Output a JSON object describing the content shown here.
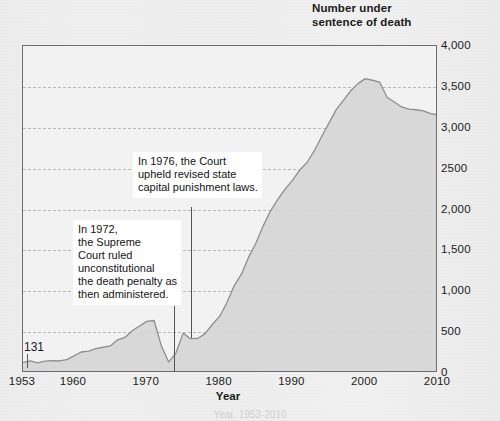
{
  "header": {
    "line1": "Number under",
    "line2": "sentence of death"
  },
  "axis": {
    "x_title": "Year",
    "y_ticks": [
      "4,000",
      "3,500",
      "3,000",
      "2500",
      "2,000",
      "1,500",
      "1,000",
      "500",
      "0"
    ],
    "x_ticks": [
      "1953",
      "1960",
      "1970",
      "1980",
      "1990",
      "2000",
      "2010"
    ]
  },
  "callouts": {
    "start_value": "131"
  },
  "annotations": {
    "note_1976": "In 1976, the Court\nupheld revised state\ncapital punishment laws.",
    "note_1972": "In 1972,\nthe Supreme\nCourt ruled\nunconstitutional\nthe death penalty as\nthen administered."
  },
  "caption": "Year, 1953-2010",
  "colors": {
    "page_background": "#eeeeee",
    "plot_background": "#f2f2f2",
    "frame": "#6d6d6d",
    "gridline": "#b9b9b9",
    "series_line": "#8e8e8e",
    "series_fill": "#d6d6d6",
    "text": "#1b1b1b",
    "annotation_background": "#ffffff"
  },
  "chart_data": {
    "type": "area",
    "title": "Number under sentence of death",
    "xlabel": "Year",
    "ylabel": "Number under sentence of death",
    "xlim": [
      1953,
      2010
    ],
    "ylim": [
      0,
      4000
    ],
    "grid": true,
    "legend": null,
    "ytick_values": [
      4000,
      3500,
      3000,
      2500,
      2000,
      1500,
      1000,
      500,
      0
    ],
    "xtick_values": [
      1953,
      1960,
      1970,
      1980,
      1990,
      2000,
      2010
    ],
    "x": [
      1953,
      1954,
      1955,
      1956,
      1957,
      1958,
      1959,
      1960,
      1961,
      1962,
      1963,
      1964,
      1965,
      1966,
      1967,
      1968,
      1969,
      1970,
      1971,
      1972,
      1973,
      1974,
      1975,
      1976,
      1977,
      1978,
      1979,
      1980,
      1981,
      1982,
      1983,
      1984,
      1985,
      1986,
      1987,
      1988,
      1989,
      1990,
      1991,
      1992,
      1993,
      1994,
      1995,
      1996,
      1997,
      1998,
      1999,
      2000,
      2001,
      2002,
      2003,
      2004,
      2005,
      2006,
      2007,
      2008,
      2009,
      2010
    ],
    "values": [
      131,
      147,
      125,
      146,
      151,
      147,
      164,
      210,
      257,
      267,
      297,
      315,
      331,
      406,
      435,
      517,
      575,
      631,
      642,
      334,
      134,
      244,
      488,
      420,
      423,
      482,
      593,
      692,
      860,
      1066,
      1209,
      1420,
      1591,
      1800,
      1984,
      2124,
      2250,
      2356,
      2482,
      2575,
      2716,
      2890,
      3054,
      3219,
      3335,
      3452,
      3540,
      3601,
      3581,
      3557,
      3374,
      3315,
      3254,
      3228,
      3220,
      3207,
      3173,
      3158
    ],
    "annotations": [
      {
        "x": 1972,
        "text": "In 1972, the Supreme Court ruled unconstitutional the death penalty as then administered."
      },
      {
        "x": 1976,
        "text": "In 1976, the Court upheld revised state capital punishment laws."
      },
      {
        "x": 1953,
        "text": "131",
        "type": "point-label"
      }
    ]
  }
}
